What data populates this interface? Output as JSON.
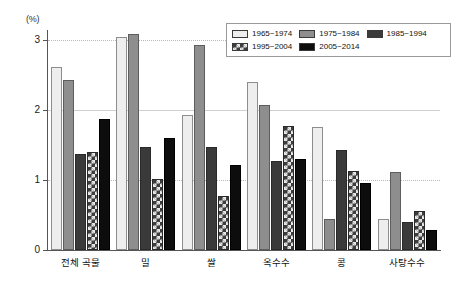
{
  "axis": {
    "unit_label": "(%)",
    "y_ticks": [
      "0",
      "1",
      "2",
      "3"
    ]
  },
  "legend": {
    "entries": [
      {
        "label": "1965~1974",
        "swatch": "light-gray-swatch"
      },
      {
        "label": "1975~1984",
        "swatch": "medium-gray-swatch"
      },
      {
        "label": "1985~1994",
        "swatch": "dark-gray-swatch"
      },
      {
        "label": "1995~2004",
        "swatch": "checkered-swatch"
      },
      {
        "label": "2005~2014",
        "swatch": "black-swatch"
      }
    ]
  },
  "chart_data": {
    "type": "bar",
    "title": "",
    "xlabel": "",
    "ylabel": "(%)",
    "ylim": [
      0,
      3.15
    ],
    "yticks": [
      0,
      1,
      2,
      3
    ],
    "grid": true,
    "legend_position": "top-right",
    "categories": [
      "전체 곡물",
      "밀",
      "쌀",
      "옥수수",
      "콩",
      "사탕수수"
    ],
    "series": [
      {
        "name": "1965~1974",
        "color": "#eeeeee",
        "values": [
          2.62,
          3.05,
          1.93,
          2.4,
          1.76,
          0.45
        ]
      },
      {
        "name": "1975~1984",
        "color": "#8e8e8e",
        "values": [
          2.43,
          3.1,
          2.93,
          2.08,
          0.45,
          1.12
        ]
      },
      {
        "name": "1985~1994",
        "color": "#3a3a3a",
        "values": [
          1.38,
          1.48,
          1.48,
          1.27,
          1.43,
          0.4
        ]
      },
      {
        "name": "1995~2004",
        "color": "#3d3d3d",
        "values": [
          1.4,
          1.02,
          0.78,
          1.78,
          1.13,
          0.56
        ]
      },
      {
        "name": "2005~2014",
        "color": "#0d0d0d",
        "values": [
          1.88,
          1.6,
          1.22,
          1.3,
          0.96,
          0.28
        ]
      }
    ]
  }
}
